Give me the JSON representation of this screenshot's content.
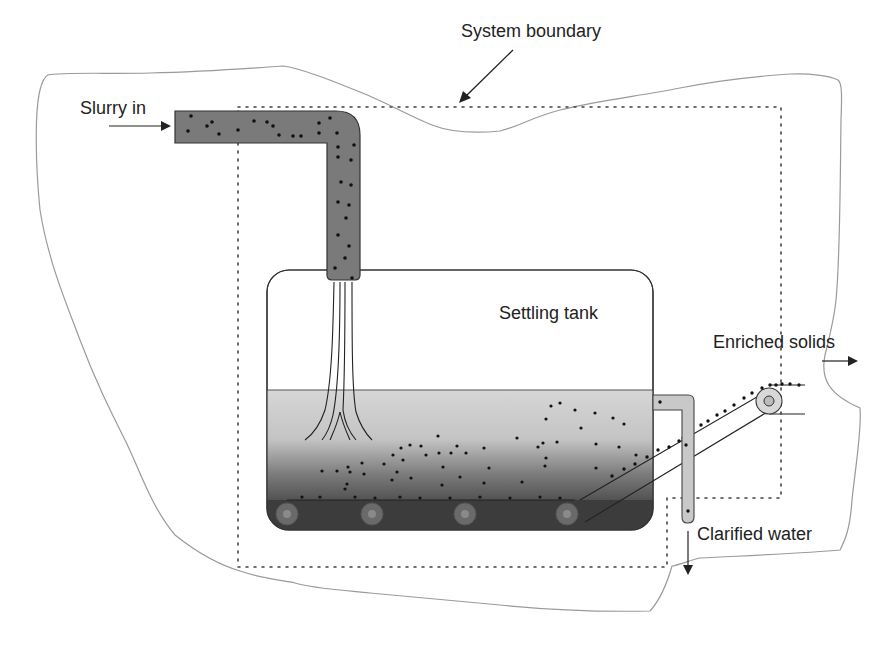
{
  "diagram": {
    "type": "process-flow",
    "labels": {
      "system_boundary": "System boundary",
      "slurry_in": "Slurry in",
      "settling_tank": "Settling tank",
      "enriched_solids": "Enriched solids",
      "clarified_water": "Clarified water"
    },
    "colors": {
      "pipe_fill": "#7a7a7a",
      "outlet_pipe_fill": "#c8c8c8",
      "water_top": "#d4d4d4",
      "water_bottom": "#3a3a3a",
      "boundary_line": "#9a9a9a",
      "dotted_line": "#444444",
      "particle": "#111111"
    },
    "nodes": [
      {
        "id": "inlet",
        "label": "Slurry in"
      },
      {
        "id": "tank",
        "label": "Settling tank"
      },
      {
        "id": "solids_out",
        "label": "Enriched solids"
      },
      {
        "id": "water_out",
        "label": "Clarified water"
      },
      {
        "id": "boundary",
        "label": "System boundary"
      }
    ],
    "edges": [
      {
        "from": "inlet",
        "to": "tank",
        "label": "Slurry in"
      },
      {
        "from": "tank",
        "to": "solids_out",
        "label": "Enriched solids"
      },
      {
        "from": "tank",
        "to": "water_out",
        "label": "Clarified water"
      }
    ]
  }
}
